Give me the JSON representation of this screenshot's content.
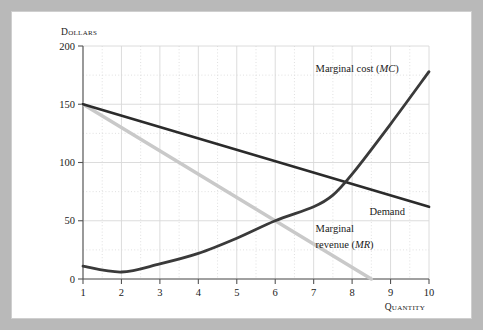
{
  "chart_data": {
    "type": "line",
    "title": "",
    "xlabel": "Quantity",
    "ylabel": "Dollars",
    "xlim": [
      1,
      10
    ],
    "ylim": [
      0,
      200
    ],
    "xticks": [
      "1",
      "2",
      "3",
      "4",
      "5",
      "6",
      "7",
      "8",
      "9",
      "10"
    ],
    "yticks": [
      "0",
      "50",
      "100",
      "150",
      "200"
    ],
    "grid": true,
    "legend_position": "inline-annotations",
    "series": [
      {
        "name": "Marginal cost (MC)",
        "label_plain": "Marginal cost (",
        "label_italic": "MC",
        "label_close": ")",
        "color": "#3a3a3a",
        "x": [
          1,
          2,
          3,
          4,
          5,
          6,
          7,
          7.5,
          8,
          9,
          10
        ],
        "values": [
          11,
          6,
          13,
          22,
          35,
          50,
          62,
          72,
          90,
          133,
          178
        ]
      },
      {
        "name": "Demand",
        "label_plain": "Demand",
        "label_italic": "",
        "label_close": "",
        "color": "#2b2b2b",
        "x": [
          1,
          10
        ],
        "values": [
          150,
          62
        ]
      },
      {
        "name": "Marginal revenue (MR)",
        "label_plain": "Marginal revenue (",
        "label_italic": "MR",
        "label_close": ")",
        "color": "#c9c9c9",
        "x": [
          1,
          8.5
        ],
        "values": [
          150,
          0
        ]
      }
    ],
    "annotations": [
      {
        "text": "Marginal cost (MC)",
        "x": 7.05,
        "y": 178
      },
      {
        "text": "Demand",
        "x": 8.45,
        "y": 55
      },
      {
        "text": "Marginal",
        "x": 7.05,
        "y": 40
      },
      {
        "text": "revenue (MR)",
        "x": 7.05,
        "y": 28
      }
    ]
  },
  "labels": {
    "y_axis_title": "Dollars",
    "x_axis_title": "Quantity",
    "mc_line1": "Marginal cost (",
    "mc_italic": "MC",
    "mc_close": ")",
    "demand": "Demand",
    "mr_line1": "Marginal",
    "mr_line2": "revenue (",
    "mr_italic": "MR",
    "mr_close": ")"
  },
  "colors": {
    "mc": "#3a3a3a",
    "demand": "#2b2b2b",
    "mr": "#c9c9c9",
    "grid": "#d8d8d8",
    "axis": "#555555",
    "frame": "#b9b9b9",
    "card": "#ffffff"
  }
}
